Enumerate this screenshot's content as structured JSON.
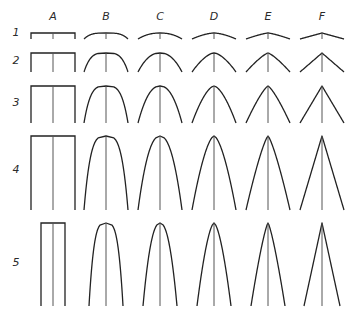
{
  "figure": {
    "columns": [
      {
        "label": "A",
        "x": 53,
        "profile": "flat"
      },
      {
        "label": "B",
        "x": 106,
        "profile": "round-blunt"
      },
      {
        "label": "C",
        "x": 160,
        "profile": "round"
      },
      {
        "label": "D",
        "x": 214,
        "profile": "ogive"
      },
      {
        "label": "E",
        "x": 268,
        "profile": "parabolic-pointed"
      },
      {
        "label": "F",
        "x": 322,
        "profile": "cone"
      }
    ],
    "rows": [
      {
        "label": "1",
        "label_y": 36,
        "top": 33,
        "bottom": 39,
        "half_width": 22
      },
      {
        "label": "2",
        "label_y": 64,
        "top": 53,
        "bottom": 72,
        "half_width": 22
      },
      {
        "label": "3",
        "label_y": 106,
        "top": 86,
        "bottom": 123,
        "half_width": 22
      },
      {
        "label": "4",
        "label_y": 173,
        "top": 136,
        "bottom": 210,
        "half_width": 22
      },
      {
        "label": "5",
        "label_y": 266,
        "top": 223,
        "bottom": 306,
        "half_width": 12
      }
    ],
    "stroke_color": "#222222",
    "center_line_color": "#555555"
  }
}
